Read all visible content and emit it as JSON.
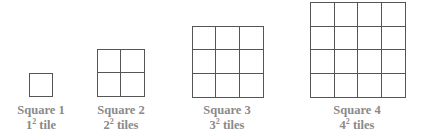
{
  "figure": {
    "squares": [
      {
        "n": 1,
        "title": "Square 1",
        "base": "1",
        "exp": "2",
        "unit": "tile",
        "left": 29,
        "top": 73,
        "size": 24,
        "label_center": 41
      },
      {
        "n": 2,
        "title": "Square 2",
        "base": "2",
        "exp": "2",
        "unit": "tiles",
        "left": 97,
        "top": 49,
        "size": 48,
        "label_center": 121
      },
      {
        "n": 3,
        "title": "Square 3",
        "base": "3",
        "exp": "2",
        "unit": "tiles",
        "left": 192,
        "top": 26,
        "size": 72,
        "label_center": 227
      },
      {
        "n": 4,
        "title": "Square 4",
        "base": "4",
        "exp": "2",
        "unit": "tiles",
        "left": 310,
        "top": 2,
        "size": 96,
        "label_center": 357
      }
    ],
    "line_color": "#555555",
    "label_color": "#8a8a8a"
  }
}
